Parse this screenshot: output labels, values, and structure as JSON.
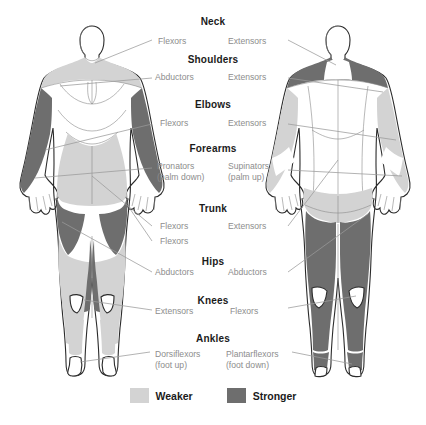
{
  "diagram": {
    "colors": {
      "weaker": "#d3d3d3",
      "stronger": "#6e6e6e",
      "skin": "#ffffff",
      "outline": "#2b2b2b",
      "leader": "#9a9a9a",
      "header_text": "#1b1b1b",
      "sub_text": "#8d8d8d",
      "background": "#ffffff"
    },
    "figures": [
      {
        "name": "anterior-figure",
        "view": "front"
      },
      {
        "name": "posterior-figure",
        "view": "back"
      }
    ]
  },
  "groups": [
    {
      "id": "neck",
      "header": "Neck",
      "left": {
        "label": "Flexors",
        "note": ""
      },
      "right": {
        "label": "Extensors",
        "note": ""
      }
    },
    {
      "id": "shoulders",
      "header": "Shoulders",
      "left": {
        "label": "Abductors",
        "note": ""
      },
      "right": {
        "label": "Extensors",
        "note": ""
      }
    },
    {
      "id": "elbows",
      "header": "Elbows",
      "left": {
        "label": "Flexors",
        "note": ""
      },
      "right": {
        "label": "Extensors",
        "note": ""
      }
    },
    {
      "id": "forearms",
      "header": "Forearms",
      "left": {
        "label": "Pronators",
        "note": "(palm down)"
      },
      "right": {
        "label": "Supinators",
        "note": "(palm up)"
      }
    },
    {
      "id": "trunk",
      "header": "Trunk",
      "left": {
        "label": "Flexors",
        "note": ""
      },
      "left_second": {
        "label": "Flexors",
        "note": ""
      },
      "right": {
        "label": "Extensors",
        "note": ""
      }
    },
    {
      "id": "hips",
      "header": "Hips",
      "left": {
        "label": "Abductors",
        "note": ""
      },
      "right": {
        "label": "Abductors",
        "note": ""
      }
    },
    {
      "id": "knees",
      "header": "Knees",
      "left": {
        "label": "Extensors",
        "note": ""
      },
      "right": {
        "label": "Flexors",
        "note": ""
      }
    },
    {
      "id": "ankles",
      "header": "Ankles",
      "left": {
        "label": "Dorsiflexors",
        "note": "(foot up)"
      },
      "right": {
        "label": "Plantarflexors",
        "note": "(foot down)"
      }
    }
  ],
  "legend": {
    "weaker_label": "Weaker",
    "stronger_label": "Stronger",
    "weaker_color": "#d3d3d3",
    "stronger_color": "#6e6e6e"
  }
}
